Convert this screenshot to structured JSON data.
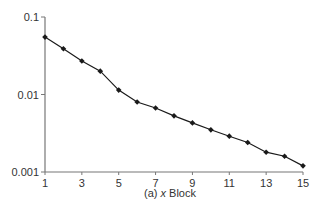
{
  "chart_data": {
    "type": "line",
    "title": "",
    "caption": "(a) x Block",
    "xlabel": "x Block",
    "ylabel": "",
    "yscale": "log",
    "ylim": [
      0.001,
      0.1
    ],
    "xlim": [
      1,
      15
    ],
    "x_ticks": [
      "1",
      "3",
      "5",
      "7",
      "9",
      "11",
      "13",
      "15"
    ],
    "y_ticks": [
      "0.1",
      "0.01",
      "0.001"
    ],
    "grid": false,
    "legend": null,
    "series": [
      {
        "name": "x Block",
        "marker": "diamond",
        "color": "#1a1a1a",
        "x": [
          1,
          2,
          3,
          4,
          5,
          6,
          7,
          8,
          9,
          10,
          11,
          12,
          13,
          14,
          15
        ],
        "values": [
          0.055,
          0.039,
          0.027,
          0.02,
          0.0114,
          0.008,
          0.0067,
          0.0053,
          0.0043,
          0.0035,
          0.0029,
          0.0024,
          0.0018,
          0.0016,
          0.0012
        ]
      }
    ]
  }
}
